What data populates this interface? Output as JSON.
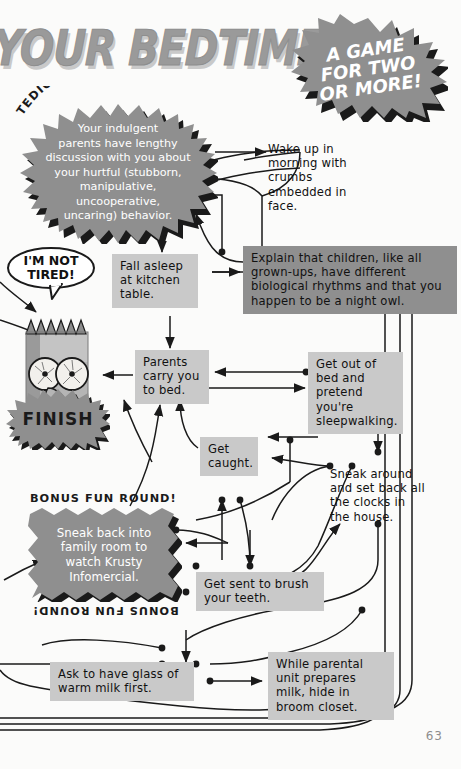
{
  "page": {
    "title": "YOUR BEDTIME",
    "page_number": "63"
  },
  "badges": {
    "game_burst": [
      "A GAME",
      "FOR TWO",
      "OR MORE!"
    ],
    "rap_session_label": "TEDIOUS RAP SESSION",
    "bonus_round_top": "BONUS FUN ROUND!",
    "bonus_round_bottom": "BONUS FUN ROUND!",
    "finish_label": "FINISH"
  },
  "speech": {
    "bart_line_1": "I'M NOT",
    "bart_line_2": "TIRED!"
  },
  "nodes": {
    "rap_session": [
      "Your indulgent",
      "parents have lengthy",
      "discussion with you about",
      "your hurtful (stubborn,",
      "manipulative, uncooperative,",
      "uncaring) behavior."
    ],
    "wake_up": "Wake up in morning with crumbs embedded in face.",
    "fall_asleep": "Fall asleep at kitchen table.",
    "explain": "Explain that children, like all grown-ups, have different biological rhythms and that you happen to be a night owl.",
    "parents_carry": "Parents carry you to bed.",
    "get_out_of_bed": "Get out of bed and pretend you're sleepwalking.",
    "get_caught": "Get caught.",
    "sneak_around": "Sneak around and set back all the clocks in the house.",
    "sneak_back": [
      "Sneak back into",
      "family room to",
      "watch Krusty",
      "Infomercial."
    ],
    "brush_teeth": "Get sent to brush your teeth.",
    "warm_milk": "Ask to have glass of warm milk first.",
    "broom_closet": "While parental unit prepares milk, hide in broom closet."
  },
  "colors": {
    "box_fill": "#c9c9c9",
    "burst_fill": "#8f8f8f",
    "burst_shadow": "#1a1a1a",
    "title_fill": "#9a9a9a",
    "ink": "#1a1a1a"
  }
}
